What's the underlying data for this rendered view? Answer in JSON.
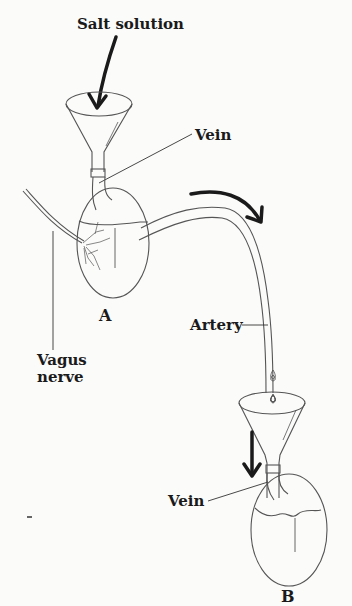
{
  "diagram": {
    "title_label": "Salt solution",
    "labels": {
      "vein_top": "Vein",
      "heart_a": "A",
      "artery": "Artery",
      "vagus_line1": "Vagus",
      "vagus_line2": "nerve",
      "vein_bottom": "Vein",
      "heart_b": "B"
    },
    "colors": {
      "ink": "#1a1a1a",
      "outline": "#555555",
      "background": "#fbfbfa"
    }
  }
}
